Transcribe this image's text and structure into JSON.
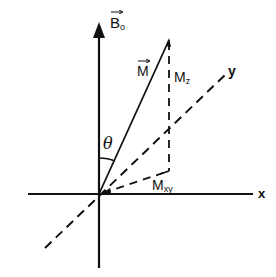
{
  "diagram": {
    "type": "vector-diagram",
    "colors": {
      "ink": "#111111",
      "background": "#ffffff"
    },
    "labels": {
      "b0": {
        "main": "B",
        "sub": "o",
        "vector": true
      },
      "m": {
        "main": "M",
        "vector": true
      },
      "mz": {
        "main": "M",
        "sub": "z"
      },
      "mxy": {
        "main": "M",
        "sub": "xy"
      },
      "theta": "θ",
      "x_axis": "x",
      "y_axis": "y"
    },
    "geometry": {
      "origin": [
        99,
        194
      ],
      "b0_axis": {
        "from": [
          99,
          268
        ],
        "to": [
          99,
          22
        ]
      },
      "x_axis": {
        "from": [
          28,
          194
        ],
        "to": [
          253,
          194
        ]
      },
      "y_axis": {
        "from": [
          45,
          248
        ],
        "to": [
          226,
          74
        ],
        "style": "dashed"
      },
      "m_vector": {
        "from": [
          99,
          194
        ],
        "to": [
          169,
          40
        ]
      },
      "mz_projection": {
        "from": [
          169,
          40
        ],
        "to": [
          169,
          171
        ],
        "style": "dashed"
      },
      "mxy_vector": {
        "from": [
          99,
          194
        ],
        "to": [
          169,
          171
        ],
        "style": "dashed"
      }
    }
  }
}
